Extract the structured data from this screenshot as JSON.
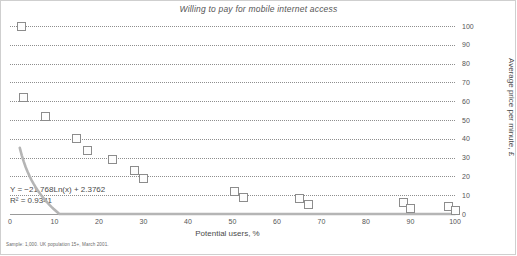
{
  "chart_data": {
    "type": "scatter",
    "title": "Willing to pay for mobile internet access",
    "xlabel": "Potential users, %",
    "ylabel": "Average price per minute, £",
    "xlim": [
      0,
      100
    ],
    "ylim": [
      0,
      100
    ],
    "grid": true,
    "legend": "none",
    "xticks": [
      "0",
      "10",
      "20",
      "30",
      "40",
      "50",
      "60",
      "70",
      "80",
      "90",
      "100"
    ],
    "yticks": [
      "0",
      "10",
      "20",
      "30",
      "40",
      "50",
      "60",
      "70",
      "80",
      "90",
      "100"
    ],
    "series": [
      {
        "name": "Survey responses",
        "points": [
          {
            "x": 2.5,
            "y": 100
          },
          {
            "x": 3.0,
            "y": 62
          },
          {
            "x": 8.0,
            "y": 52
          },
          {
            "x": 15.0,
            "y": 40
          },
          {
            "x": 17.5,
            "y": 34
          },
          {
            "x": 23.0,
            "y": 29
          },
          {
            "x": 28.0,
            "y": 23
          },
          {
            "x": 30.0,
            "y": 19
          },
          {
            "x": 50.5,
            "y": 12
          },
          {
            "x": 52.5,
            "y": 9
          },
          {
            "x": 65.0,
            "y": 8
          },
          {
            "x": 67.0,
            "y": 5
          },
          {
            "x": 88.5,
            "y": 6
          },
          {
            "x": 90.0,
            "y": 3
          },
          {
            "x": 98.5,
            "y": 4
          },
          {
            "x": 100.0,
            "y": 2
          }
        ]
      }
    ],
    "trendline": {
      "type": "logarithmic",
      "equation": "Y  =  −21.768Ln(x) + 2.3762",
      "r_squared_label": "R²  =  0.9341",
      "coefficient": -21.768,
      "intercept": 2.3762,
      "r_squared": 0.9341
    },
    "footnote": "Sample: 1,000. UK population 15+, March 2001.",
    "colors": {
      "marker_fill": "#fdfdfd",
      "marker_border": "#8c8c8c",
      "trendline": "#b5b5b5",
      "gridline": "#8e8e8e",
      "text": "#4a4a4a"
    }
  }
}
